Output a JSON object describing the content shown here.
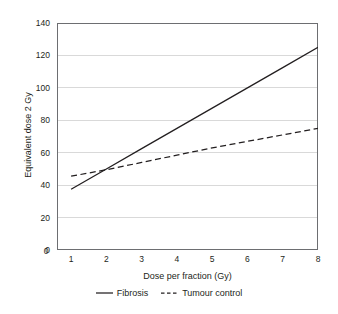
{
  "chart_data": {
    "type": "line",
    "title": "",
    "xlabel": "Dose per fraction (Gy)",
    "ylabel": "Equivalent dose 2 Gy",
    "xlim": [
      0.6,
      8
    ],
    "ylim": [
      0,
      140
    ],
    "xticks": [
      1,
      2,
      3,
      4,
      5,
      6,
      7,
      8
    ],
    "xtick_labels": [
      "1",
      "2",
      "3",
      "4",
      "5",
      "6",
      "7",
      "8"
    ],
    "yticks": [
      0,
      20,
      40,
      60,
      80,
      100,
      120,
      140
    ],
    "ytick_labels": [
      "0",
      "20",
      "40",
      "60",
      "80",
      "100",
      "120",
      "140"
    ],
    "origin_label": "0",
    "grid": "horizontal",
    "grid_color": "#d9d9d9",
    "axis_color": "#6d6e71",
    "line_color": "#231f20",
    "background": "#ffffff",
    "legend_position": "bottom",
    "series": [
      {
        "name": "Fibrosis",
        "style": "solid",
        "x": [
          1,
          2,
          3,
          4,
          5,
          6,
          7,
          8
        ],
        "values": [
          37.5,
          50,
          62.5,
          75,
          87.5,
          100,
          112.5,
          125
        ]
      },
      {
        "name": "Tumour control",
        "style": "dashed",
        "x": [
          1,
          2,
          3,
          4,
          5,
          6,
          7,
          8
        ],
        "values": [
          45.5,
          49.5,
          54,
          58.5,
          63,
          67,
          71,
          75
        ]
      }
    ]
  },
  "legend": {
    "items": [
      {
        "label": "Fibrosis",
        "style": "solid"
      },
      {
        "label": "Tumour control",
        "style": "dashed"
      }
    ]
  }
}
